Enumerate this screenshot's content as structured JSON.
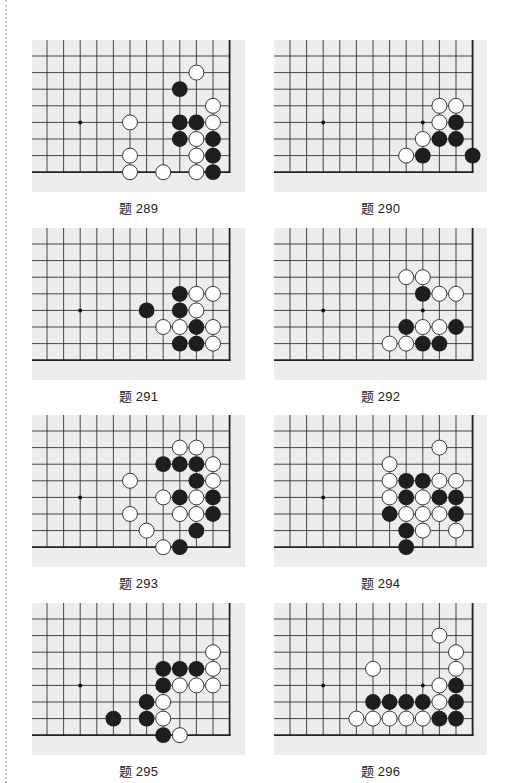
{
  "page": {
    "problems": [
      {
        "id": "289",
        "caption": "题 289",
        "x": 32,
        "y": 40,
        "first_col_x": 15,
        "star_points": [
          [
            2,
            4
          ]
        ],
        "black": [
          [
            8,
            2
          ],
          [
            8,
            4
          ],
          [
            9,
            4
          ],
          [
            8,
            5
          ],
          [
            10,
            5
          ],
          [
            10,
            6
          ],
          [
            10,
            7
          ]
        ],
        "white": [
          [
            9,
            1
          ],
          [
            10,
            3
          ],
          [
            5,
            4
          ],
          [
            10,
            4
          ],
          [
            9,
            5
          ],
          [
            5,
            6
          ],
          [
            9,
            6
          ],
          [
            5,
            7
          ],
          [
            7,
            7
          ],
          [
            9,
            7
          ]
        ]
      },
      {
        "id": "290",
        "caption": "题 290",
        "x": 274,
        "y": 40,
        "first_col_x": 16,
        "star_points": [
          [
            2,
            4
          ],
          [
            8,
            4
          ]
        ],
        "black": [
          [
            10,
            4
          ],
          [
            9,
            5
          ],
          [
            10,
            5
          ],
          [
            8,
            6
          ],
          [
            11,
            6
          ]
        ],
        "white": [
          [
            9,
            3
          ],
          [
            10,
            3
          ],
          [
            9,
            4
          ],
          [
            8,
            5
          ],
          [
            7,
            6
          ]
        ]
      },
      {
        "id": "291",
        "caption": "题 291",
        "x": 32,
        "y": 228,
        "first_col_x": 15,
        "star_points": [
          [
            2,
            4
          ]
        ],
        "black": [
          [
            8,
            3
          ],
          [
            6,
            4
          ],
          [
            8,
            4
          ],
          [
            9,
            5
          ],
          [
            8,
            6
          ],
          [
            9,
            6
          ]
        ],
        "white": [
          [
            9,
            3
          ],
          [
            10,
            3
          ],
          [
            9,
            4
          ],
          [
            7,
            5
          ],
          [
            8,
            5
          ],
          [
            10,
            5
          ],
          [
            10,
            6
          ]
        ]
      },
      {
        "id": "292",
        "caption": "题 292",
        "x": 274,
        "y": 228,
        "first_col_x": 16,
        "star_points": [
          [
            2,
            4
          ],
          [
            8,
            4
          ]
        ],
        "black": [
          [
            8,
            3
          ],
          [
            7,
            5
          ],
          [
            10,
            5
          ],
          [
            8,
            6
          ],
          [
            9,
            6
          ]
        ],
        "white": [
          [
            7,
            2
          ],
          [
            8,
            2
          ],
          [
            9,
            3
          ],
          [
            10,
            3
          ],
          [
            8,
            5
          ],
          [
            9,
            5
          ],
          [
            6,
            6
          ],
          [
            7,
            6
          ]
        ]
      },
      {
        "id": "293",
        "caption": "题 293",
        "x": 32,
        "y": 415,
        "first_col_x": 15,
        "star_points": [
          [
            2,
            4
          ]
        ],
        "black": [
          [
            7,
            2
          ],
          [
            8,
            2
          ],
          [
            9,
            2
          ],
          [
            9,
            3
          ],
          [
            8,
            4
          ],
          [
            10,
            4
          ],
          [
            10,
            5
          ],
          [
            9,
            6
          ],
          [
            8,
            7
          ]
        ],
        "white": [
          [
            8,
            1
          ],
          [
            9,
            1
          ],
          [
            10,
            2
          ],
          [
            5,
            3
          ],
          [
            10,
            3
          ],
          [
            7,
            4
          ],
          [
            9,
            4
          ],
          [
            5,
            5
          ],
          [
            8,
            5
          ],
          [
            9,
            5
          ],
          [
            6,
            6
          ],
          [
            7,
            7
          ]
        ]
      },
      {
        "id": "294",
        "caption": "题 294",
        "x": 274,
        "y": 415,
        "first_col_x": 16,
        "star_points": [
          [
            2,
            4
          ]
        ],
        "black": [
          [
            7,
            3
          ],
          [
            8,
            3
          ],
          [
            7,
            4
          ],
          [
            9,
            4
          ],
          [
            10,
            4
          ],
          [
            6,
            5
          ],
          [
            10,
            5
          ],
          [
            7,
            6
          ],
          [
            7,
            7
          ]
        ],
        "white": [
          [
            9,
            1
          ],
          [
            6,
            2
          ],
          [
            6,
            3
          ],
          [
            9,
            3
          ],
          [
            10,
            3
          ],
          [
            6,
            4
          ],
          [
            8,
            4
          ],
          [
            7,
            5
          ],
          [
            8,
            5
          ],
          [
            9,
            5
          ],
          [
            8,
            6
          ],
          [
            10,
            6
          ]
        ]
      },
      {
        "id": "295",
        "caption": "题 295",
        "x": 32,
        "y": 603,
        "first_col_x": 15,
        "star_points": [
          [
            2,
            4
          ]
        ],
        "black": [
          [
            7,
            3
          ],
          [
            8,
            3
          ],
          [
            9,
            3
          ],
          [
            7,
            4
          ],
          [
            6,
            5
          ],
          [
            4,
            6
          ],
          [
            6,
            6
          ],
          [
            7,
            7
          ]
        ],
        "white": [
          [
            10,
            2
          ],
          [
            10,
            3
          ],
          [
            8,
            4
          ],
          [
            9,
            4
          ],
          [
            10,
            4
          ],
          [
            7,
            5
          ],
          [
            7,
            6
          ],
          [
            8,
            7
          ]
        ]
      },
      {
        "id": "296",
        "caption": "题 296",
        "x": 274,
        "y": 603,
        "first_col_x": 16,
        "star_points": [
          [
            2,
            4
          ],
          [
            8,
            4
          ]
        ],
        "black": [
          [
            10,
            4
          ],
          [
            5,
            5
          ],
          [
            6,
            5
          ],
          [
            7,
            5
          ],
          [
            8,
            5
          ],
          [
            10,
            5
          ],
          [
            9,
            6
          ],
          [
            10,
            6
          ]
        ],
        "white": [
          [
            9,
            1
          ],
          [
            10,
            2
          ],
          [
            5,
            3
          ],
          [
            10,
            3
          ],
          [
            9,
            4
          ],
          [
            9,
            5
          ],
          [
            4,
            6
          ],
          [
            5,
            6
          ],
          [
            6,
            6
          ],
          [
            7,
            6
          ],
          [
            8,
            6
          ]
        ]
      }
    ]
  },
  "board_style": {
    "background": "#ededed",
    "line_color": "#333333",
    "edge_color": "#222222",
    "black_stone": "#1e1e1e",
    "white_stone": "#ffffff",
    "white_outline": "#222222",
    "cols": 12,
    "rows": 8,
    "cell": 16.6
  }
}
